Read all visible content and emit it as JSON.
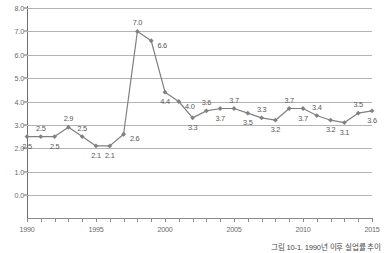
{
  "chart_data": {
    "type": "line",
    "title": "",
    "xlabel": "",
    "ylabel": "",
    "ylim": [
      0.0,
      8.0
    ],
    "xlim": [
      1990,
      2015
    ],
    "ytick_step": 1.0,
    "ytick_labels": [
      "0.0",
      "1.0",
      "2.0",
      "3.0",
      "4.0",
      "5.0",
      "6.0",
      "7.0",
      "8.0"
    ],
    "ytick_values": [
      0.0,
      1.0,
      2.0,
      3.0,
      4.0,
      5.0,
      6.0,
      7.0,
      8.0
    ],
    "xtick_labels": [
      "1990",
      "1995",
      "2000",
      "2005",
      "2010",
      "2015"
    ],
    "xtick_values": [
      1990,
      1995,
      2000,
      2005,
      2010,
      2015
    ],
    "grid": true,
    "legend": "none",
    "series_color": "#808080",
    "marker": "diamond",
    "x": [
      1990,
      1991,
      1992,
      1993,
      1994,
      1995,
      1996,
      1997,
      1998,
      1999,
      2000,
      2001,
      2002,
      2003,
      2004,
      2005,
      2006,
      2007,
      2008,
      2009,
      2010,
      2011,
      2012,
      2013,
      2014,
      2015
    ],
    "values": [
      2.5,
      2.5,
      2.5,
      2.9,
      2.5,
      2.1,
      2.1,
      2.6,
      7.0,
      6.6,
      4.4,
      4.0,
      3.3,
      3.6,
      3.7,
      3.7,
      3.5,
      3.3,
      3.2,
      3.7,
      3.7,
      3.4,
      3.2,
      3.1,
      3.5,
      3.6
    ],
    "point_labels": [
      "2.5",
      "2.5",
      "2.5",
      "2.9",
      "2.5",
      "2.1",
      "2.1",
      "2.6",
      "7.0",
      "6.6",
      "4.4",
      "4.0",
      "3.3",
      "3.6",
      "3.7",
      "3.7",
      "3.5",
      "3.3",
      "3.2",
      "3.7",
      "3.7",
      "3.4",
      "3.2",
      "3.1",
      "3.5",
      "3.6"
    ],
    "label_positions": [
      "below",
      "above",
      "below",
      "above",
      "above",
      "below",
      "below",
      "right",
      "above",
      "right",
      "below",
      "right",
      "below",
      "above",
      "below",
      "above",
      "below",
      "above",
      "below",
      "above",
      "below",
      "above",
      "below",
      "below",
      "above",
      "below"
    ]
  },
  "caption": {
    "text": "그림 10-1. 1990년 이후 실업률 추이"
  }
}
